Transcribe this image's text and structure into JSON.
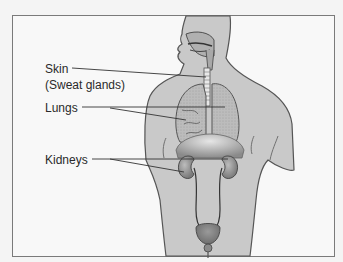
{
  "figure": {
    "labels": [
      {
        "id": "skin",
        "text": "Skin",
        "subtext": "(Sweat glands)"
      },
      {
        "id": "lungs",
        "text": "Lungs"
      },
      {
        "id": "kidneys",
        "text": "Kidneys"
      }
    ],
    "colors": {
      "background": "#f8f8f8",
      "frame": "#7a7a7a",
      "body": "#c9c9c9",
      "outline": "#555555",
      "lungs": "#b5b5b5",
      "organ": "#8f8f8f",
      "leader": "#333333"
    }
  }
}
